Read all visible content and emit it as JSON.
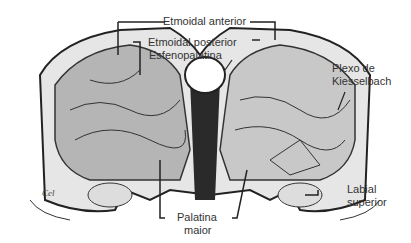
{
  "figure": {
    "labels": {
      "etmoidal_anterior": "Etmoidal anterior",
      "etmoidal_posterior": "Etmoidal posterior",
      "esfenopalatina": "Esfenopalatina",
      "plexo_line1": "Plexo de",
      "plexo_line2": "Kiesselbach",
      "labial_line1": "Labial",
      "labial_line2": "superior",
      "palatina_line1": "Palatina",
      "palatina_line2": "maior"
    },
    "signature": "Cel",
    "colors": {
      "ink": "#333333",
      "shade_dark": "#2a2a2a",
      "shade_mid": "#8a8a8a",
      "shade_light": "#d8d8d8",
      "background": "#ffffff"
    }
  }
}
